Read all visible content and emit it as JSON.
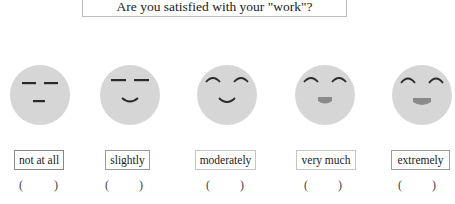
{
  "title": "Are you satisfied with your \"work\"?",
  "colors": {
    "face_fill": "#d6d6d6",
    "feature_stroke": "#2a2a2a",
    "mouth_fill": "#8a8a8a",
    "border": "#888888"
  },
  "scale": [
    {
      "label": "not at all",
      "face": "neutral-face",
      "open_paren": "(",
      "close_paren": ")"
    },
    {
      "label": "slightly",
      "face": "slight-smile-face",
      "open_paren": "(",
      "close_paren": ")"
    },
    {
      "label": "moderately",
      "face": "smile-face",
      "open_paren": "(",
      "close_paren": ")"
    },
    {
      "label": "very much",
      "face": "happy-face",
      "open_paren": "(",
      "close_paren": ")"
    },
    {
      "label": "extremely",
      "face": "very-happy-face",
      "open_paren": "(",
      "close_paren": ")"
    }
  ]
}
